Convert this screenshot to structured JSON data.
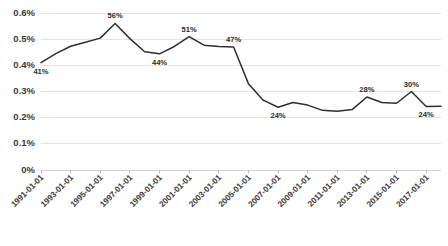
{
  "chart_data": {
    "type": "line",
    "title": "",
    "subtitle": "",
    "xlabel": "",
    "ylabel": "",
    "grid": true,
    "legend": "none",
    "ylim": [
      0,
      0.006
    ],
    "ytick_labels": [
      "0.6%",
      "0.5%",
      "0.4%",
      "0.3%",
      "0.2%",
      "0.1%",
      "0%"
    ],
    "ytick_values": [
      0.006,
      0.005,
      0.004,
      0.003,
      0.002,
      0.001,
      0
    ],
    "xtick_labels": [
      "1991-01-01",
      "1993-01-01",
      "1995-01-01",
      "1997-01-01",
      "1999-01-01",
      "2001-01-01",
      "2003-01-01",
      "2005-01-01",
      "2007-01-01",
      "2009-01-01",
      "2011-01-01",
      "2013-01-01",
      "2015-01-01",
      "2017-01-01"
    ],
    "x": [
      "1991-01-01",
      "1992-01-01",
      "1993-01-01",
      "1994-01-01",
      "1995-01-01",
      "1996-01-01",
      "1997-01-01",
      "1998-01-01",
      "1999-01-01",
      "2000-01-01",
      "2001-01-01",
      "2002-01-01",
      "2003-01-01",
      "2004-01-01",
      "2005-01-01",
      "2006-01-01",
      "2007-01-01",
      "2008-01-01",
      "2009-01-01",
      "2010-01-01",
      "2011-01-01",
      "2012-01-01",
      "2013-01-01",
      "2014-01-01",
      "2015-01-01",
      "2016-01-01",
      "2017-01-01",
      "2018-01-01"
    ],
    "values": [
      0.0041,
      0.00445,
      0.00473,
      0.00488,
      0.00504,
      0.0056,
      0.00502,
      0.00452,
      0.00444,
      0.00472,
      0.0051,
      0.00477,
      0.00472,
      0.0047,
      0.0033,
      0.00267,
      0.0024,
      0.00258,
      0.00248,
      0.00228,
      0.00225,
      0.00231,
      0.00279,
      0.00258,
      0.00255,
      0.003,
      0.00243,
      0.00244
    ],
    "point_labels": [
      {
        "index": 0,
        "text": "41%",
        "position": "below"
      },
      {
        "index": 5,
        "text": "56%",
        "position": "above"
      },
      {
        "index": 8,
        "text": "44%",
        "position": "below"
      },
      {
        "index": 10,
        "text": "51%",
        "position": "above"
      },
      {
        "index": 13,
        "text": "47%",
        "position": "above"
      },
      {
        "index": 16,
        "text": "24%",
        "position": "below"
      },
      {
        "index": 22,
        "text": "28%",
        "position": "above"
      },
      {
        "index": 25,
        "text": "30%",
        "position": "above"
      },
      {
        "index": 26,
        "text": "24%",
        "position": "below"
      }
    ],
    "colors": {
      "series": "#2f2f2f",
      "grid": "#e4e4e4",
      "text": "#3b3b3b",
      "background": "#ffffff"
    }
  },
  "caption": {
    "text": ""
  }
}
